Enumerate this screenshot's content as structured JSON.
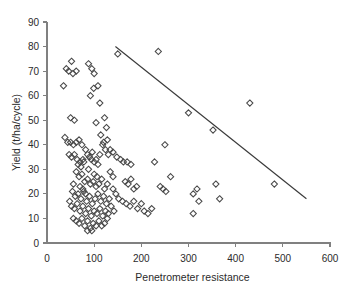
{
  "chart_data": {
    "type": "scatter",
    "title": "",
    "xlabel": "Penetrometer resistance",
    "ylabel": "Yield (t/ha/cycle)",
    "xlim": [
      0,
      600
    ],
    "ylim": [
      0,
      90
    ],
    "xticks": [
      0,
      100,
      200,
      300,
      400,
      500,
      600
    ],
    "yticks": [
      0,
      10,
      20,
      30,
      40,
      50,
      60,
      70,
      80,
      90
    ],
    "grid": false,
    "legend": null,
    "marker": "open-diamond",
    "marker_color": "#4a4a4a",
    "axis_color": "#808080",
    "series": [
      {
        "name": "Observations",
        "points": [
          [
            35,
            64
          ],
          [
            41,
            71
          ],
          [
            46,
            70
          ],
          [
            52,
            74
          ],
          [
            55,
            69
          ],
          [
            62,
            70
          ],
          [
            50,
            51
          ],
          [
            58,
            50
          ],
          [
            38,
            43
          ],
          [
            44,
            41
          ],
          [
            50,
            41
          ],
          [
            56,
            40
          ],
          [
            62,
            41
          ],
          [
            68,
            42
          ],
          [
            74,
            40
          ],
          [
            47,
            36
          ],
          [
            52,
            35
          ],
          [
            58,
            36
          ],
          [
            64,
            34
          ],
          [
            70,
            33
          ],
          [
            76,
            34
          ],
          [
            88,
            73
          ],
          [
            95,
            71
          ],
          [
            100,
            69
          ],
          [
            92,
            60
          ],
          [
            99,
            63
          ],
          [
            108,
            64
          ],
          [
            112,
            57
          ],
          [
            122,
            51
          ],
          [
            126,
            47
          ],
          [
            104,
            49
          ],
          [
            114,
            44
          ],
          [
            120,
            41
          ],
          [
            128,
            42
          ],
          [
            134,
            38
          ],
          [
            140,
            37
          ],
          [
            150,
            77
          ],
          [
            118,
            40
          ],
          [
            124,
            38
          ],
          [
            130,
            36
          ],
          [
            82,
            38
          ],
          [
            86,
            36
          ],
          [
            90,
            35
          ],
          [
            94,
            34
          ],
          [
            96,
            37
          ],
          [
            100,
            33
          ],
          [
            104,
            34
          ],
          [
            108,
            32
          ],
          [
            112,
            36
          ],
          [
            62,
            29
          ],
          [
            68,
            27
          ],
          [
            74,
            28
          ],
          [
            80,
            25
          ],
          [
            86,
            26
          ],
          [
            92,
            24
          ],
          [
            98,
            25
          ],
          [
            104,
            23
          ],
          [
            110,
            24
          ],
          [
            116,
            26
          ],
          [
            122,
            22
          ],
          [
            128,
            24
          ],
          [
            134,
            29
          ],
          [
            140,
            27
          ],
          [
            54,
            21
          ],
          [
            60,
            19
          ],
          [
            66,
            20
          ],
          [
            72,
            18
          ],
          [
            78,
            21
          ],
          [
            84,
            17
          ],
          [
            90,
            19
          ],
          [
            96,
            16
          ],
          [
            102,
            18
          ],
          [
            108,
            20
          ],
          [
            114,
            17
          ],
          [
            120,
            19
          ],
          [
            126,
            16
          ],
          [
            132,
            18
          ],
          [
            48,
            17
          ],
          [
            52,
            15
          ],
          [
            58,
            14
          ],
          [
            64,
            16
          ],
          [
            70,
            13
          ],
          [
            76,
            15
          ],
          [
            82,
            12
          ],
          [
            88,
            14
          ],
          [
            94,
            11
          ],
          [
            100,
            13
          ],
          [
            106,
            12
          ],
          [
            112,
            14
          ],
          [
            118,
            11
          ],
          [
            124,
            13
          ],
          [
            130,
            12
          ],
          [
            56,
            10
          ],
          [
            62,
            9
          ],
          [
            68,
            8
          ],
          [
            74,
            10
          ],
          [
            80,
            7
          ],
          [
            86,
            9
          ],
          [
            92,
            6
          ],
          [
            98,
            8
          ],
          [
            104,
            7
          ],
          [
            110,
            9
          ],
          [
            116,
            7
          ],
          [
            122,
            8
          ],
          [
            128,
            10
          ],
          [
            86,
            5
          ],
          [
            95,
            5
          ],
          [
            70,
            23
          ],
          [
            76,
            22
          ],
          [
            82,
            20
          ],
          [
            100,
            28
          ],
          [
            106,
            27
          ],
          [
            66,
            32
          ],
          [
            72,
            31
          ],
          [
            78,
            33
          ],
          [
            88,
            30
          ],
          [
            56,
            24
          ],
          [
            148,
            35
          ],
          [
            156,
            34
          ],
          [
            162,
            33
          ],
          [
            170,
            33
          ],
          [
            178,
            32
          ],
          [
            166,
            25
          ],
          [
            172,
            24
          ],
          [
            178,
            26
          ],
          [
            184,
            22
          ],
          [
            190,
            23
          ],
          [
            152,
            18
          ],
          [
            160,
            17
          ],
          [
            168,
            16
          ],
          [
            176,
            15
          ],
          [
            184,
            17
          ],
          [
            192,
            14
          ],
          [
            200,
            16
          ],
          [
            206,
            13
          ],
          [
            214,
            12
          ],
          [
            222,
            14
          ],
          [
            228,
            33
          ],
          [
            240,
            23
          ],
          [
            246,
            22
          ],
          [
            252,
            21
          ],
          [
            236,
            78
          ],
          [
            250,
            40
          ],
          [
            262,
            27
          ],
          [
            300,
            53
          ],
          [
            310,
            20
          ],
          [
            318,
            22
          ],
          [
            322,
            17
          ],
          [
            352,
            46
          ],
          [
            358,
            24
          ],
          [
            366,
            18
          ],
          [
            310,
            12
          ],
          [
            430,
            57
          ],
          [
            482,
            24
          ],
          [
            140,
            22
          ],
          [
            146,
            20
          ],
          [
            136,
            15
          ],
          [
            142,
            13
          ]
        ]
      }
    ],
    "trendline": {
      "x1": 145,
      "y1": 80,
      "x2": 550,
      "y2": 18
    }
  }
}
